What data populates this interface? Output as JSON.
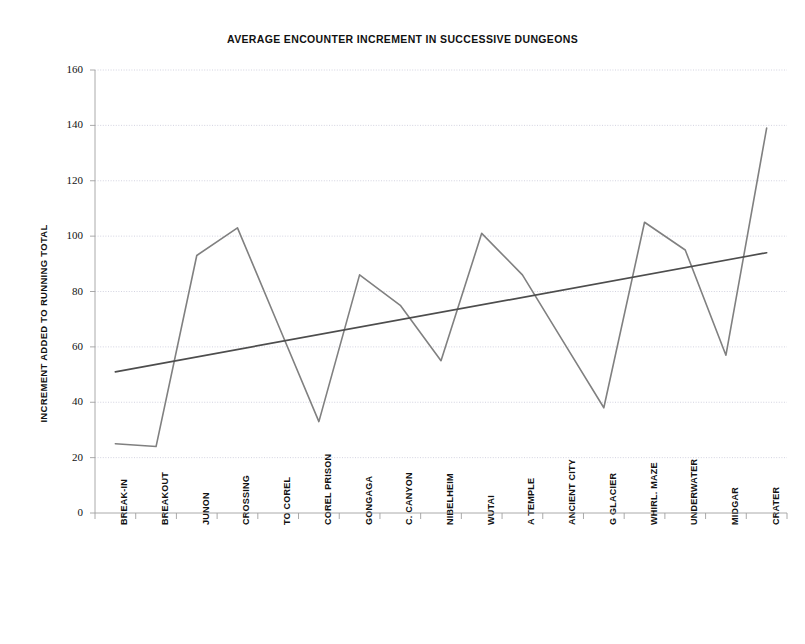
{
  "chart_data": {
    "type": "line",
    "title": "AVERAGE ENCOUNTER INCREMENT IN SUCCESSIVE DUNGEONS",
    "xlabel": "",
    "ylabel": "INCREMENT ADDED TO RUNNING TOTAL",
    "ylim": [
      0,
      160
    ],
    "ytick_step": 20,
    "yticks": [
      0,
      20,
      40,
      60,
      80,
      100,
      120,
      140,
      160
    ],
    "grid": true,
    "grid_axis": "y",
    "legend": "none",
    "categories": [
      "BREAK-IN",
      "BREAKOUT",
      "JUNON",
      "CROSSING",
      "TO COREL",
      "COREL PRISON",
      "GONGAGA",
      "C. CANYON",
      "NIBELHEIM",
      "WUTAI",
      "A TEMPLE",
      "ANCIENT CITY",
      "G GLACIER",
      "WHIRL. MAZE",
      "UNDERWATER",
      "MIDGAR",
      "CRATER"
    ],
    "series": [
      {
        "name": "increment",
        "color": "#808080",
        "values": [
          25,
          24,
          93,
          103,
          68,
          33,
          86,
          75,
          55,
          101,
          86,
          62,
          38,
          105,
          95,
          57,
          139
        ]
      },
      {
        "name": "trendline",
        "color": "#4d4d4d",
        "type": "line",
        "endpoints": [
          51,
          94
        ]
      }
    ],
    "colors": {
      "data_line": "#808080",
      "trend_line": "#4d4d4d",
      "gridline": "#c8c8d8",
      "axis": "#a0a0a0",
      "text": "#111111",
      "background": "#ffffff"
    }
  }
}
